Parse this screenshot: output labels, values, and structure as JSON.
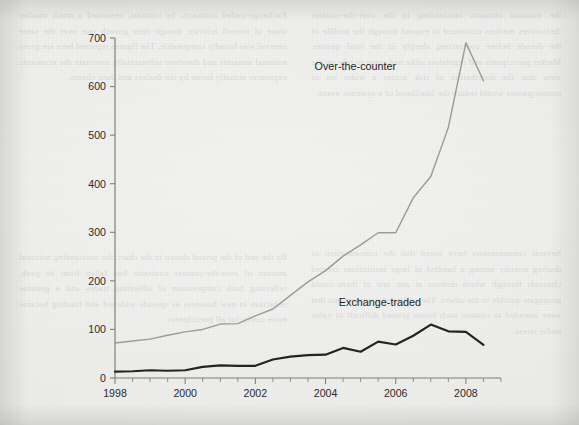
{
  "page": {
    "background_color": "#ececea",
    "ink_color": "#2b2b29",
    "bleed_through_text": {
      "col1": "the notional amounts outstanding in the over-the-counter derivatives markets continued to expand through the middle of the decade before contracting sharply in the final quarter. Market participants and regulators alike had come to rely on the view that the distribution of risk across a wider set of counterparties would reduce the likelihood of a systemic event.",
      "col2": "Exchange-traded contracts, by contrast, remained a much smaller share of overall activity, though their growth rate over the same interval was broadly comparable. The figures reported here are gross notional amounts and therefore substantially overstate the economic exposures actually borne by the dealers and their clients.",
      "col3": "Several commentators have noted that the concentration of dealing activity among a handful of large institutions created channels through which distress at any one of them could propagate quickly to the others. The collateral arrangements that were intended to contain such losses proved difficult to value under stress.",
      "col4": "By the end of the period shown in the chart, the outstanding notional amount of over-the-counter contracts had fallen from its peak, reflecting both compression of offsetting trades and a genuine reduction in new business as spreads widened and funding became more costly for all participants."
    }
  },
  "chart_data": {
    "type": "line",
    "title": "",
    "subtitle": "",
    "xlabel": "",
    "ylabel": "",
    "xlim": [
      1998.0,
      2009.0
    ],
    "ylim": [
      0,
      700
    ],
    "y_ticks": [
      0,
      100,
      200,
      300,
      400,
      500,
      600,
      700
    ],
    "y_tick_labels": [
      "0",
      "100",
      "200",
      "300",
      "400",
      "500",
      "600",
      "700"
    ],
    "x_ticks": [
      1998,
      1998.5,
      1999,
      1999.5,
      2000,
      2000.5,
      2001,
      2001.5,
      2002,
      2002.5,
      2003,
      2003.5,
      2004,
      2004.5,
      2005,
      2005.5,
      2006,
      2006.5,
      2007,
      2007.5,
      2008,
      2008.5,
      2009
    ],
    "x_tick_labels_shown": [
      "1998",
      "2000",
      "2002",
      "2004",
      "2006",
      "2008"
    ],
    "x_labeled_ticks": [
      1998,
      2000,
      2002,
      2004,
      2006,
      2008
    ],
    "grid": false,
    "legend_position": "inline-annotations",
    "annotations": [
      {
        "text": "Over-the-counter",
        "x": 2004.85,
        "y": 635
      },
      {
        "text": "Exchange-traded",
        "x": 2005.55,
        "y": 148
      }
    ],
    "series": [
      {
        "name": "Over-the-counter",
        "color": "#9b9b97",
        "line_width": 1.45,
        "x": [
          1998.0,
          1998.5,
          1999.0,
          1999.5,
          2000.0,
          2000.5,
          2001.0,
          2001.5,
          2002.0,
          2002.5,
          2003.0,
          2003.5,
          2004.0,
          2004.5,
          2005.0,
          2005.5,
          2006.0,
          2006.5,
          2007.0,
          2007.5,
          2008.0,
          2008.5
        ],
        "values": [
          72,
          76,
          80,
          88,
          95,
          100,
          111,
          112,
          128,
          142,
          170,
          198,
          221,
          251,
          274,
          299,
          299,
          371,
          415,
          516,
          690,
          612
        ]
      },
      {
        "name": "Exchange-traded",
        "color": "#232321",
        "line_width": 2.15,
        "x": [
          1998.0,
          1998.5,
          1999.0,
          1999.5,
          2000.0,
          2000.5,
          2001.0,
          2001.5,
          2002.0,
          2002.5,
          2003.0,
          2003.5,
          2004.0,
          2004.5,
          2005.0,
          2005.5,
          2006.0,
          2006.5,
          2007.0,
          2007.5,
          2008.0,
          2008.5
        ],
        "values": [
          13,
          14,
          16,
          15,
          16,
          23,
          26,
          25,
          25,
          38,
          44,
          47,
          48,
          62,
          54,
          75,
          69,
          87,
          110,
          96,
          95,
          68
        ]
      }
    ]
  }
}
